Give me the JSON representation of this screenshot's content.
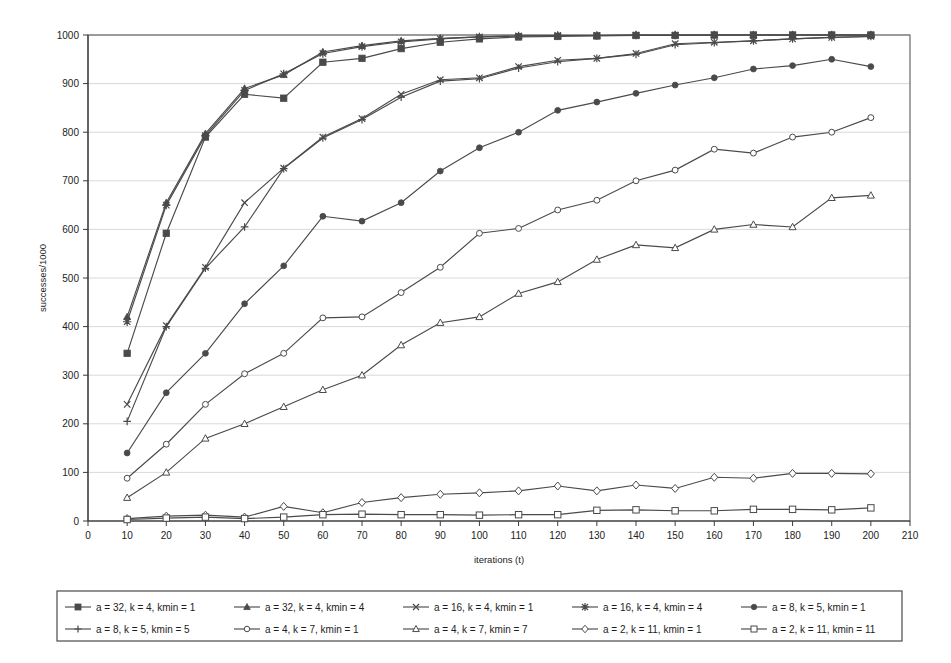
{
  "chart_data": {
    "type": "line",
    "title": "",
    "xlabel": "iterations (t)",
    "ylabel": "successes/1000",
    "xlim": [
      0,
      210
    ],
    "ylim": [
      0,
      1000
    ],
    "xticks": [
      0,
      10,
      20,
      30,
      40,
      50,
      60,
      70,
      80,
      90,
      100,
      110,
      120,
      130,
      140,
      150,
      160,
      170,
      180,
      190,
      200,
      210
    ],
    "yticks": [
      0,
      100,
      200,
      300,
      400,
      500,
      600,
      700,
      800,
      900,
      1000
    ],
    "grid": "horizontal",
    "legend_position": "bottom",
    "line_color": "#4a4a4a",
    "x": [
      10,
      20,
      30,
      40,
      50,
      60,
      70,
      80,
      90,
      100,
      110,
      120,
      130,
      140,
      150,
      160,
      170,
      180,
      190,
      200
    ],
    "series": [
      {
        "name": "a = 32, k = 4, kmin = 1",
        "marker": "filled-square",
        "values": [
          345,
          592,
          790,
          878,
          870,
          944,
          952,
          972,
          985,
          992,
          996,
          997,
          998,
          999,
          999,
          1000,
          1000,
          1000,
          1000,
          1000
        ]
      },
      {
        "name": "a = 32, k = 4, kmin = 4",
        "marker": "filled-triangle",
        "values": [
          420,
          655,
          797,
          890,
          918,
          965,
          978,
          988,
          993,
          996,
          998,
          999,
          999,
          1000,
          1000,
          1000,
          1000,
          1000,
          1000,
          1000
        ]
      },
      {
        "name": "a = 16, k = 4, kmin = 1",
        "marker": "cross-x",
        "values": [
          240,
          402,
          522,
          655,
          726,
          790,
          828,
          878,
          908,
          912,
          935,
          948,
          952,
          962,
          982,
          985,
          988,
          992,
          995,
          997
        ]
      },
      {
        "name": "a = 16, k = 4, kmin = 4",
        "marker": "star",
        "values": [
          410,
          650,
          793,
          886,
          920,
          962,
          976,
          986,
          992,
          996,
          998,
          999,
          999,
          1000,
          1000,
          1000,
          1000,
          1000,
          1000,
          1000
        ]
      },
      {
        "name": "a = 8, k = 5, kmin = 1",
        "marker": "filled-circle",
        "values": [
          140,
          264,
          345,
          447,
          525,
          627,
          617,
          655,
          720,
          768,
          800,
          845,
          862,
          880,
          897,
          912,
          930,
          937,
          950,
          935
        ]
      },
      {
        "name": "a = 8, k = 5, kmin = 5",
        "marker": "plus",
        "values": [
          205,
          400,
          520,
          605,
          725,
          788,
          826,
          872,
          905,
          910,
          932,
          945,
          952,
          960,
          980,
          984,
          988,
          992,
          995,
          997
        ]
      },
      {
        "name": "a = 4, k = 7, kmin = 1",
        "marker": "open-circle",
        "values": [
          88,
          158,
          240,
          303,
          345,
          418,
          420,
          470,
          522,
          592,
          602,
          640,
          660,
          700,
          722,
          765,
          757,
          790,
          800,
          830
        ]
      },
      {
        "name": "a = 4, k = 7, kmin = 7",
        "marker": "open-triangle",
        "values": [
          48,
          100,
          170,
          200,
          235,
          270,
          300,
          362,
          408,
          420,
          468,
          492,
          538,
          568,
          562,
          600,
          610,
          605,
          665,
          670
        ]
      },
      {
        "name": "a = 2, k = 11, kmin = 1",
        "marker": "open-diamond",
        "values": [
          5,
          10,
          12,
          8,
          30,
          17,
          38,
          48,
          55,
          58,
          62,
          72,
          62,
          74,
          67,
          90,
          88,
          98,
          98,
          97
        ]
      },
      {
        "name": "a = 2, k = 11, kmin = 11",
        "marker": "open-square",
        "values": [
          3,
          6,
          8,
          5,
          8,
          13,
          14,
          13,
          13,
          12,
          13,
          13,
          22,
          23,
          21,
          21,
          24,
          24,
          23,
          27
        ]
      }
    ]
  },
  "axis": {
    "y_title": "successes/1000",
    "x_title": "iterations (t)"
  }
}
